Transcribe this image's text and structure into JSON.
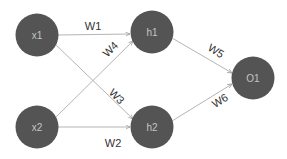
{
  "diagram": {
    "title": "",
    "type": "neural-network",
    "colors": {
      "background": "#ffffff",
      "node_fill": "#545454",
      "node_text": "#c4c4c4",
      "edge": "#b5b5b5",
      "edge_label": "#333333"
    },
    "nodes": [
      {
        "id": "x1",
        "label": "x1",
        "layer": "input"
      },
      {
        "id": "x2",
        "label": "x2",
        "layer": "input"
      },
      {
        "id": "h1",
        "label": "h1",
        "layer": "hidden"
      },
      {
        "id": "h2",
        "label": "h2",
        "layer": "hidden"
      },
      {
        "id": "o1",
        "label": "O1",
        "layer": "output"
      }
    ],
    "edges": [
      {
        "from": "x1",
        "to": "h1",
        "label": "W1"
      },
      {
        "from": "x2",
        "to": "h2",
        "label": "W2"
      },
      {
        "from": "x1",
        "to": "h2",
        "label": "W3"
      },
      {
        "from": "x2",
        "to": "h1",
        "label": "W4"
      },
      {
        "from": "h1",
        "to": "o1",
        "label": "W5"
      },
      {
        "from": "h2",
        "to": "o1",
        "label": "W6"
      }
    ]
  }
}
